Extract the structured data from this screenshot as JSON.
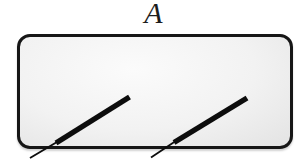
{
  "figure": {
    "label": "A"
  },
  "panel": {
    "border_color": "#161616",
    "fill_center": "#fbfbfb",
    "fill_edge": "#e3e3e3"
  },
  "sticks": {
    "color": "#0d0d0d",
    "thick_width": 5.4,
    "thin_width": 1.9,
    "items": [
      {
        "name": "left-stick",
        "thick": {
          "x1": 129.5,
          "y1": 97,
          "x2": 56,
          "y2": 143
        },
        "thin": {
          "x1": 57,
          "y1": 142,
          "x2": 30,
          "y2": 158
        }
      },
      {
        "name": "right-stick",
        "thick": {
          "x1": 247,
          "y1": 98,
          "x2": 174,
          "y2": 142.5
        },
        "thin": {
          "x1": 175,
          "y1": 141.5,
          "x2": 151,
          "y2": 157.5
        }
      }
    ]
  }
}
